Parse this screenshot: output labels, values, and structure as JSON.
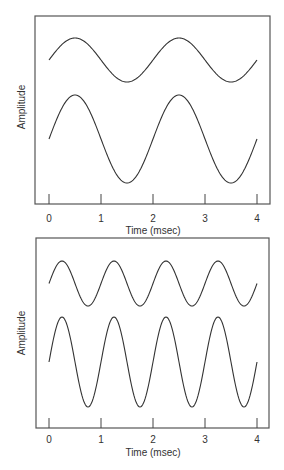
{
  "chart_data": [
    {
      "type": "line",
      "title": "",
      "xlabel": "Time (msec)",
      "ylabel": "Amplitude",
      "xlim": [
        0,
        4
      ],
      "xticks": [
        "0",
        "1",
        "2",
        "3",
        "4"
      ],
      "grid": false,
      "legend": null,
      "series": [
        {
          "name": "upper wave (small amplitude)",
          "function": "sine",
          "period_msec": 2,
          "amplitude_rel": 1,
          "phase": 0
        },
        {
          "name": "lower wave (large amplitude)",
          "function": "sine",
          "period_msec": 2,
          "amplitude_rel": 2,
          "phase": 0
        }
      ]
    },
    {
      "type": "line",
      "title": "",
      "xlabel": "Time (msec)",
      "ylabel": "Amplitude",
      "xlim": [
        0,
        4
      ],
      "xticks": [
        "0",
        "1",
        "2",
        "3",
        "4"
      ],
      "grid": false,
      "legend": null,
      "series": [
        {
          "name": "upper wave (small amplitude)",
          "function": "sine",
          "period_msec": 1,
          "amplitude_rel": 1,
          "phase": 0
        },
        {
          "name": "lower wave (large amplitude)",
          "function": "sine",
          "period_msec": 1,
          "amplitude_rel": 2,
          "phase": 0
        }
      ]
    }
  ],
  "panels": [
    {
      "ylabel": "Amplitude",
      "xlabel": "Time (msec)",
      "ticks": [
        "0",
        "1",
        "2",
        "3",
        "4"
      ]
    },
    {
      "ylabel": "Amplitude",
      "xlabel": "Time (msec)",
      "ticks": [
        "0",
        "1",
        "2",
        "3",
        "4"
      ]
    }
  ]
}
